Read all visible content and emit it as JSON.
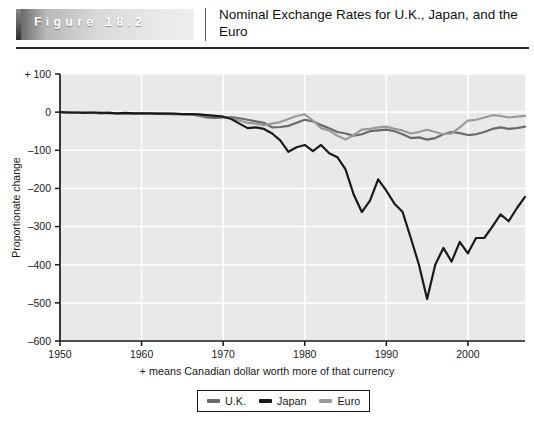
{
  "header": {
    "figure_label": "Figure 18.2",
    "title": "Nominal Exchange Rates for U.K., Japan, and the Euro"
  },
  "footnote": "+ means Canadian dollar worth more of that currency",
  "legend": {
    "items": [
      {
        "label": "U.K.",
        "color": "#6a6a6a"
      },
      {
        "label": "Japan",
        "color": "#1a1a1a"
      },
      {
        "label": "Euro",
        "color": "#9a9a9a"
      }
    ]
  },
  "colors": {
    "plot_background": "#e9e9e9",
    "gridline": "#ffffff",
    "axis": "#1a1a1a",
    "uk": "#6a6a6a",
    "japan": "#1a1a1a",
    "euro": "#9a9a9a"
  },
  "chart_data": {
    "type": "line",
    "title": "Nominal Exchange Rates for U.K., Japan, and the Euro",
    "xlabel": "",
    "ylabel": "Proportionate change",
    "annotation": "+ means Canadian dollar worth more of that currency",
    "xlim": [
      1950,
      2007
    ],
    "ylim": [
      -600,
      100
    ],
    "xticks": [
      1950,
      1960,
      1970,
      1980,
      1990,
      2000
    ],
    "yticks": [
      100,
      0,
      -100,
      -200,
      -300,
      -400,
      -500,
      -600
    ],
    "ytick_labels": [
      "+ 100",
      "0",
      "–100",
      "–200",
      "–300",
      "–400",
      "–500",
      "–600"
    ],
    "grid": true,
    "legend_position": "bottom",
    "series": [
      {
        "name": "U.K.",
        "color": "#6a6a6a",
        "x": [
          1950,
          1951,
          1952,
          1953,
          1954,
          1955,
          1956,
          1957,
          1958,
          1959,
          1960,
          1961,
          1962,
          1963,
          1964,
          1965,
          1966,
          1967,
          1968,
          1969,
          1970,
          1971,
          1972,
          1973,
          1974,
          1975,
          1976,
          1977,
          1978,
          1979,
          1980,
          1981,
          1982,
          1983,
          1984,
          1985,
          1986,
          1987,
          1988,
          1989,
          1990,
          1991,
          1992,
          1993,
          1994,
          1995,
          1996,
          1997,
          1998,
          1999,
          2000,
          2001,
          2002,
          2003,
          2004,
          2005,
          2006,
          2007
        ],
        "y": [
          0,
          -1,
          -2,
          -1,
          -2,
          -3,
          -2,
          -3,
          -4,
          -3,
          -3,
          -4,
          -4,
          -4,
          -5,
          -5,
          -6,
          -9,
          -14,
          -15,
          -14,
          -13,
          -16,
          -20,
          -24,
          -28,
          -40,
          -39,
          -36,
          -28,
          -20,
          -24,
          -34,
          -42,
          -52,
          -56,
          -62,
          -58,
          -50,
          -48,
          -46,
          -50,
          -58,
          -68,
          -66,
          -72,
          -68,
          -58,
          -52,
          -55,
          -60,
          -58,
          -52,
          -44,
          -40,
          -44,
          -42,
          -38
        ]
      },
      {
        "name": "Japan",
        "color": "#1a1a1a",
        "x": [
          1950,
          1951,
          1952,
          1953,
          1954,
          1955,
          1956,
          1957,
          1958,
          1959,
          1960,
          1961,
          1962,
          1963,
          1964,
          1965,
          1966,
          1967,
          1968,
          1969,
          1970,
          1971,
          1972,
          1973,
          1974,
          1975,
          1976,
          1977,
          1978,
          1979,
          1980,
          1981,
          1982,
          1983,
          1984,
          1985,
          1986,
          1987,
          1988,
          1989,
          1990,
          1991,
          1992,
          1993,
          1994,
          1995,
          1996,
          1997,
          1998,
          1999,
          2000,
          2001,
          2002,
          2003,
          2004,
          2005,
          2006,
          2007
        ],
        "y": [
          0,
          -1,
          -1,
          -2,
          -1,
          -2,
          -2,
          -3,
          -2,
          -3,
          -3,
          -3,
          -4,
          -4,
          -4,
          -5,
          -5,
          -6,
          -8,
          -10,
          -12,
          -18,
          -30,
          -42,
          -40,
          -44,
          -56,
          -74,
          -104,
          -92,
          -86,
          -102,
          -86,
          -108,
          -118,
          -150,
          -216,
          -262,
          -232,
          -176,
          -206,
          -240,
          -262,
          -330,
          -400,
          -490,
          -400,
          -356,
          -392,
          -340,
          -370,
          -330,
          -330,
          -300,
          -268,
          -286,
          -252,
          -222
        ]
      },
      {
        "name": "Euro",
        "color": "#9a9a9a",
        "x": [
          1950,
          1951,
          1952,
          1953,
          1954,
          1955,
          1956,
          1957,
          1958,
          1959,
          1960,
          1961,
          1962,
          1963,
          1964,
          1965,
          1966,
          1967,
          1968,
          1969,
          1970,
          1971,
          1972,
          1973,
          1974,
          1975,
          1976,
          1977,
          1978,
          1979,
          1980,
          1981,
          1982,
          1983,
          1984,
          1985,
          1986,
          1987,
          1988,
          1989,
          1990,
          1991,
          1992,
          1993,
          1994,
          1995,
          1996,
          1997,
          1998,
          1999,
          2000,
          2001,
          2002,
          2003,
          2004,
          2005,
          2006,
          2007
        ],
        "y": [
          0,
          -1,
          -1,
          -2,
          -2,
          -2,
          -2,
          -3,
          -3,
          -3,
          -4,
          -4,
          -4,
          -5,
          -5,
          -5,
          -6,
          -7,
          -9,
          -10,
          -12,
          -16,
          -22,
          -28,
          -30,
          -34,
          -30,
          -26,
          -18,
          -10,
          -6,
          -22,
          -42,
          -48,
          -62,
          -72,
          -60,
          -46,
          -44,
          -40,
          -38,
          -44,
          -48,
          -56,
          -52,
          -46,
          -52,
          -58,
          -56,
          -40,
          -22,
          -20,
          -14,
          -8,
          -10,
          -14,
          -12,
          -10
        ]
      }
    ]
  }
}
